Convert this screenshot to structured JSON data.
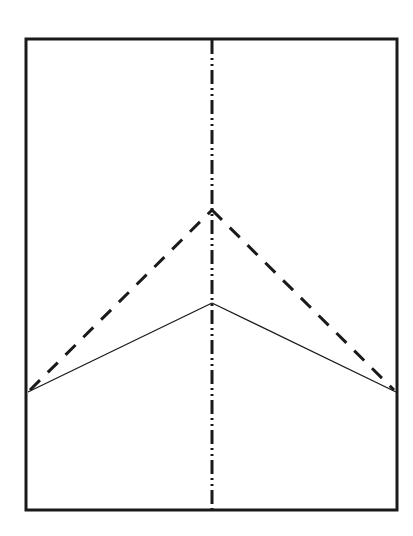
{
  "diagram": {
    "type": "fold-pattern",
    "paper": {
      "x": 26,
      "y": 39,
      "width": 371,
      "height": 471,
      "stroke": "#1a1a1a"
    },
    "lines": [
      {
        "name": "mountain-fold-center",
        "style": "dash-dot-dot",
        "x1": 212,
        "y1": 39,
        "x2": 212,
        "y2": 510
      },
      {
        "name": "valley-fold-left",
        "style": "dashed",
        "x1": 28,
        "y1": 392,
        "x2": 212,
        "y2": 210
      },
      {
        "name": "valley-fold-right",
        "style": "dashed",
        "x1": 212,
        "y1": 210,
        "x2": 396,
        "y2": 392
      },
      {
        "name": "crease-left",
        "style": "solid-thin",
        "x1": 28,
        "y1": 392,
        "x2": 212,
        "y2": 303
      },
      {
        "name": "crease-right",
        "style": "solid-thin",
        "x1": 212,
        "y1": 303,
        "x2": 396,
        "y2": 392
      }
    ],
    "ink_color": "#1a1a1a"
  }
}
